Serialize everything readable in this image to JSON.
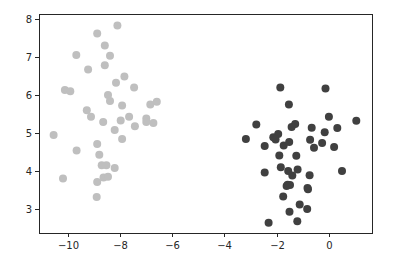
{
  "chart_data": {
    "type": "scatter",
    "title": "",
    "xlabel": "",
    "ylabel": "",
    "xlim": [
      -11.1,
      1.65
    ],
    "ylim": [
      2.37,
      8.13
    ],
    "grid": false,
    "legend": null,
    "xticks": [
      -10,
      -8,
      -6,
      -4,
      -2,
      0
    ],
    "xtick_labels": [
      "−10",
      "−8",
      "−6",
      "−4",
      "−2",
      "0"
    ],
    "yticks": [
      3,
      4,
      5,
      6,
      7,
      8
    ],
    "ytick_labels": [
      "3",
      "4",
      "5",
      "6",
      "7",
      "8"
    ],
    "series": [
      {
        "name": "cluster-light",
        "color": "#bfbfbf",
        "points": [
          [
            -8.1,
            7.83
          ],
          [
            -8.87,
            7.62
          ],
          [
            -8.58,
            7.3
          ],
          [
            -9.67,
            7.05
          ],
          [
            -8.38,
            7.03
          ],
          [
            -8.58,
            6.78
          ],
          [
            -9.22,
            6.67
          ],
          [
            -7.83,
            6.49
          ],
          [
            -8.15,
            6.32
          ],
          [
            -7.46,
            6.2
          ],
          [
            -10.11,
            6.13
          ],
          [
            -9.9,
            6.1
          ],
          [
            -8.46,
            6.0
          ],
          [
            -8.38,
            5.84
          ],
          [
            -7.92,
            5.72
          ],
          [
            -6.84,
            5.75
          ],
          [
            -6.59,
            5.82
          ],
          [
            -9.27,
            5.6
          ],
          [
            -9.11,
            5.43
          ],
          [
            -7.65,
            5.43
          ],
          [
            -7.97,
            5.33
          ],
          [
            -8.64,
            5.29
          ],
          [
            -6.99,
            5.38
          ],
          [
            -6.99,
            5.29
          ],
          [
            -6.72,
            5.26
          ],
          [
            -7.43,
            5.18
          ],
          [
            -8.2,
            5.08
          ],
          [
            -10.54,
            4.95
          ],
          [
            -7.92,
            4.84
          ],
          [
            -8.87,
            4.71
          ],
          [
            -9.66,
            4.54
          ],
          [
            -8.79,
            4.43
          ],
          [
            -8.7,
            4.15
          ],
          [
            -8.52,
            4.15
          ],
          [
            -8.2,
            4.08
          ],
          [
            -10.18,
            3.8
          ],
          [
            -8.63,
            3.83
          ],
          [
            -8.46,
            3.85
          ],
          [
            -8.87,
            3.71
          ],
          [
            -8.89,
            3.32
          ]
        ]
      },
      {
        "name": "cluster-dark",
        "color": "#404040",
        "points": [
          [
            -1.86,
            6.2
          ],
          [
            -0.13,
            6.17
          ],
          [
            -1.53,
            5.75
          ],
          [
            0.0,
            5.43
          ],
          [
            1.05,
            5.32
          ],
          [
            -2.78,
            5.22
          ],
          [
            -1.29,
            5.24
          ],
          [
            -1.43,
            5.16
          ],
          [
            -0.66,
            5.14
          ],
          [
            0.32,
            5.13
          ],
          [
            -0.16,
            5.02
          ],
          [
            -3.18,
            4.84
          ],
          [
            -1.94,
            4.97
          ],
          [
            -2.13,
            4.89
          ],
          [
            -2.04,
            4.83
          ],
          [
            -0.72,
            4.82
          ],
          [
            -2.46,
            4.66
          ],
          [
            -1.73,
            4.67
          ],
          [
            -1.52,
            4.76
          ],
          [
            -0.26,
            4.74
          ],
          [
            -0.57,
            4.61
          ],
          [
            0.2,
            4.63
          ],
          [
            -1.9,
            4.41
          ],
          [
            -1.25,
            4.4
          ],
          [
            -2.46,
            3.96
          ],
          [
            -1.84,
            4.1
          ],
          [
            -1.56,
            4.0
          ],
          [
            -1.4,
            3.88
          ],
          [
            -1.2,
            4.04
          ],
          [
            -0.74,
            3.89
          ],
          [
            0.5,
            4.0
          ],
          [
            -1.58,
            3.64
          ],
          [
            -0.82,
            3.55
          ],
          [
            -1.62,
            3.61
          ],
          [
            -1.49,
            3.63
          ],
          [
            -0.8,
            3.52
          ],
          [
            -1.75,
            3.33
          ],
          [
            -1.12,
            3.12
          ],
          [
            -0.83,
            3.0
          ],
          [
            -1.51,
            2.93
          ],
          [
            -2.31,
            2.64
          ],
          [
            -1.21,
            2.68
          ]
        ]
      }
    ]
  },
  "layout": {
    "axes_box": {
      "left": 39,
      "top": 14,
      "right": 372,
      "bottom": 233
    },
    "marker_radius": 4
  }
}
